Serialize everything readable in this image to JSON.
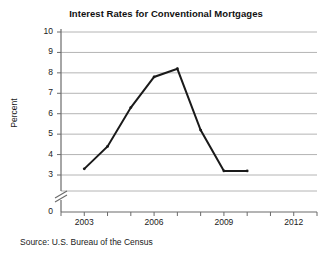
{
  "chart_data": {
    "type": "line",
    "title": "Interest Rates for Conventional Mortgages",
    "xlabel": "",
    "ylabel": "Percent",
    "source": "Source: U.S. Bureau of the Census",
    "x": [
      2003,
      2004,
      2005,
      2006,
      2007,
      2008,
      2009,
      2010
    ],
    "values": [
      3.3,
      4.4,
      6.3,
      7.8,
      8.2,
      5.2,
      3.2,
      3.2
    ],
    "series": [
      {
        "name": "Interest Rate",
        "values": [
          3.3,
          4.4,
          6.3,
          7.8,
          8.2,
          5.2,
          3.2,
          3.2
        ]
      }
    ],
    "ylim": [
      3,
      10
    ],
    "y_axis_has_break": true,
    "y_axis_break_between": [
      0,
      3
    ],
    "ytick_labels": [
      "0",
      "3",
      "4",
      "5",
      "6",
      "7",
      "8",
      "9",
      "10"
    ],
    "ytick_values": [
      0,
      3,
      4,
      5,
      6,
      7,
      8,
      9,
      10
    ],
    "xlim": [
      2002,
      2013
    ],
    "xtick_values": [
      2002,
      2003,
      2004,
      2005,
      2006,
      2007,
      2008,
      2009,
      2010,
      2011,
      2012,
      2013
    ],
    "xtick_labels": [
      "2003",
      "2006",
      "2009",
      "2012"
    ],
    "xtick_labeled_values": [
      2003,
      2006,
      2009,
      2012
    ],
    "grid": "horizontal",
    "legend": "none",
    "line_color": "#1a1a1a",
    "grid_color": "#b4b4b4",
    "axis_color": "#6b6b6b",
    "background_color": "#ffffff"
  }
}
